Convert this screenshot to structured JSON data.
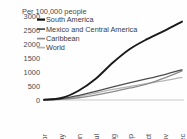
{
  "chart_data": {
    "type": "line",
    "title": "Per 100,000 people",
    "subtitle": "",
    "xlabel": "",
    "ylabel": "",
    "grid": false,
    "legend_position": "top-left",
    "ylim": [
      0,
      3000
    ],
    "yticks": [
      "0",
      "500",
      "1000",
      "1500",
      "2000",
      "2500",
      "3000"
    ],
    "ytick_values": [
      0,
      500,
      1000,
      1500,
      2000,
      2500,
      3000
    ],
    "categories": [
      "21-Apr",
      "21-May",
      "20-Jun",
      "20-Jul",
      "19-Aug",
      "18-Sep",
      "18-Oct",
      "17-Nov",
      "17-Dec"
    ],
    "x": [
      "21-Apr",
      "21-May",
      "20-Jun",
      "20-Jul",
      "19-Aug",
      "18-Sep",
      "18-Oct",
      "17-Nov",
      "17-Dec"
    ],
    "series": [
      {
        "name": "South America",
        "color": "#1a1a1a",
        "width": 1.9,
        "values": [
          10,
          70,
          330,
          760,
          1340,
          1830,
          2180,
          2480,
          2800
        ]
      },
      {
        "name": "Mexico and Central America",
        "color": "#4d4d4d",
        "width": 1.3,
        "values": [
          8,
          45,
          160,
          310,
          470,
          620,
          760,
          910,
          1080
        ]
      },
      {
        "name": "Caribbean",
        "color": "#8c8c8c",
        "width": 1.3,
        "values": [
          4,
          20,
          80,
          175,
          300,
          430,
          580,
          790,
          1040
        ]
      },
      {
        "name": "World",
        "color": "#b5b5b5",
        "width": 1.3,
        "values": [
          6,
          35,
          130,
          250,
          380,
          490,
          590,
          690,
          810
        ]
      }
    ]
  },
  "legend": {
    "items": [
      {
        "label": "South America"
      },
      {
        "label": "Mexico and Central America"
      },
      {
        "label": "Caribbean"
      },
      {
        "label": "World"
      }
    ]
  }
}
